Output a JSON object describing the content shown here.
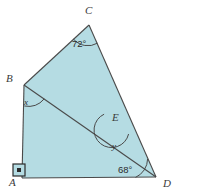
{
  "figure": {
    "background_color": "#ffffff",
    "fill_color": "#b5dce3",
    "stroke_color": "#4a4a4a",
    "vertices": [
      {
        "id": "A",
        "label": "A",
        "x": 22,
        "y": 178
      },
      {
        "id": "B",
        "label": "B",
        "x": 24,
        "y": 85
      },
      {
        "id": "C",
        "label": "C",
        "x": 89,
        "y": 25
      },
      {
        "id": "D",
        "label": "D",
        "x": 156,
        "y": 177
      },
      {
        "id": "E",
        "label": "E",
        "x": 118,
        "y": 124
      }
    ],
    "vertex_label_positions": [
      {
        "id": "A",
        "label": "A",
        "x": 9,
        "y": 186
      },
      {
        "id": "B",
        "label": "B",
        "x": 8,
        "y": 82
      },
      {
        "id": "C",
        "label": "C",
        "x": 86,
        "y": 13
      },
      {
        "id": "D",
        "label": "D",
        "x": 163,
        "y": 186
      },
      {
        "id": "E",
        "label": "E",
        "x": 114,
        "y": 121
      }
    ],
    "angles": [
      {
        "id": "angle-C",
        "label": "72°",
        "value": 72,
        "unit": "degrees",
        "vertex": "C",
        "label_x": 73,
        "label_y": 46
      },
      {
        "id": "angle-D",
        "label": "68°",
        "value": 68,
        "unit": "degrees",
        "vertex": "D",
        "label_x": 120,
        "label_y": 172
      },
      {
        "id": "angle-B",
        "label": "x",
        "value": null,
        "unit": "variable",
        "vertex": "B",
        "label_x": 24,
        "label_y": 104
      },
      {
        "id": "angle-E",
        "label": "y",
        "value": null,
        "unit": "variable",
        "vertex": "E",
        "label_x": 113,
        "label_y": 148
      }
    ],
    "markers": [
      {
        "id": "right-angle-A",
        "type": "right-angle-square",
        "vertex": "A",
        "x": 13,
        "y": 164,
        "size": 12
      }
    ],
    "segments": [
      {
        "id": "segment-AB",
        "from": "A",
        "to": "B"
      },
      {
        "id": "segment-BC",
        "from": "B",
        "to": "C"
      },
      {
        "id": "segment-CD",
        "from": "C",
        "to": "D"
      },
      {
        "id": "segment-DA",
        "from": "D",
        "to": "A"
      },
      {
        "id": "segment-BD",
        "from": "B",
        "to": "D"
      }
    ]
  }
}
